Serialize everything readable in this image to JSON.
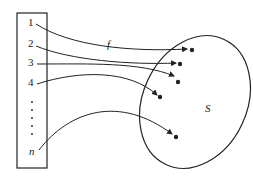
{
  "diagram": {
    "function_label": "f",
    "set_label": "S",
    "domain_labels": [
      "1",
      "2",
      "3",
      "4",
      "n"
    ],
    "ellipsis": "⋮",
    "stroke_color": "#222222",
    "background": "#ffffff"
  }
}
